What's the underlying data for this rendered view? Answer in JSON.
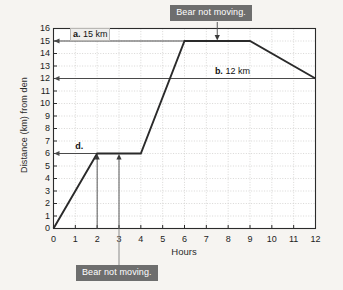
{
  "chart_data": {
    "type": "line",
    "title": "",
    "xlabel": "Hours",
    "ylabel": "Distance (km) from den",
    "xlim": [
      0,
      12
    ],
    "ylim": [
      0,
      16
    ],
    "xticks": [
      0,
      1,
      2,
      3,
      4,
      5,
      6,
      7,
      8,
      9,
      10,
      11,
      12
    ],
    "yticks": [
      0,
      1,
      2,
      3,
      4,
      5,
      6,
      7,
      8,
      9,
      10,
      11,
      12,
      13,
      14,
      15,
      16
    ],
    "grid": true,
    "legend": "none",
    "series": [
      {
        "name": "Bear distance from den",
        "x": [
          0,
          2,
          4,
          6,
          9,
          12
        ],
        "values": [
          0,
          6,
          6,
          15,
          15,
          12
        ]
      }
    ],
    "reference_lines": [
      {
        "name": "a-15km-line",
        "y": 15,
        "label": "a. 15 km"
      },
      {
        "name": "b-12km-line",
        "y": 12,
        "label": "b. 12 km"
      },
      {
        "name": "d-6km-line",
        "y": 6,
        "label": "d."
      }
    ],
    "annotations": [
      {
        "name": "label-a",
        "text": "a. 15 km",
        "bold_prefix": "a.",
        "rest": " 15 km",
        "at_y": 15,
        "at_x": 0.75,
        "boxed": true
      },
      {
        "name": "label-b",
        "text": "b. 12 km",
        "bold_prefix": "b.",
        "rest": " 12 km",
        "at_y": 12,
        "at_x": 7.3,
        "boxed": false
      },
      {
        "name": "label-d",
        "text": "d.",
        "bold_prefix": "d.",
        "rest": "",
        "at_y": 6,
        "at_x": 0.9,
        "boxed": false
      }
    ],
    "callouts": [
      {
        "name": "callout-top",
        "text": "Bear not moving.",
        "points_to_x": 7.5,
        "points_to_y": 15,
        "position": "top"
      },
      {
        "name": "callout-bottom",
        "text": "Bear not moving.",
        "points_to_x": 3,
        "points_to_y": 6,
        "position": "bottom"
      }
    ],
    "marker_arrows": [
      {
        "name": "arrow-x2",
        "x": 2,
        "y": 6,
        "direction": "up"
      },
      {
        "name": "arrow-x3",
        "x": 3,
        "y": 6,
        "direction": "up"
      }
    ]
  },
  "colors": {
    "background": "#f6f4f1",
    "plot_background": "#ffffff",
    "axis": "#2b2b2b",
    "grid": "#c9c7c4",
    "data_line": "#2a2a2a",
    "reference_line": "#4a4a4a",
    "callout_background": "#6e6e6e",
    "callout_text": "#ffffff",
    "label_text": "#121212"
  }
}
